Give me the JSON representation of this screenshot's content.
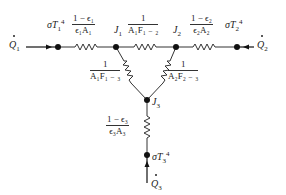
{
  "diagram": {
    "nodes": {
      "q1": {
        "label": "Q̇₁",
        "text": "Q",
        "sub": "1"
      },
      "q2": {
        "label": "Q̇₂",
        "text": "Q",
        "sub": "2"
      },
      "q3": {
        "label": "Q̇₃",
        "text": "Q",
        "sub": "3"
      },
      "eb1": {
        "label": "σT₁⁴",
        "text": "σT",
        "sub": "1",
        "sup": "4"
      },
      "eb2": {
        "label": "σT₂⁴",
        "text": "σT",
        "sub": "2",
        "sup": "4"
      },
      "eb3": {
        "label": "σT₃⁴",
        "text": "σT",
        "sub": "3",
        "sup": "4"
      },
      "j1": {
        "label": "J₁",
        "text": "J",
        "sub": "1"
      },
      "j2": {
        "label": "J₂",
        "text": "J",
        "sub": "2"
      },
      "j3": {
        "label": "J₃",
        "text": "J",
        "sub": "3"
      }
    },
    "resistors": {
      "r_surf1": {
        "num": "1 − ϵ₁",
        "den": "ϵ₁A₁"
      },
      "r_surf2": {
        "num": "1 − ϵ₂",
        "den": "ϵ₂A₂"
      },
      "r_surf3": {
        "num": "1 − ϵ₃",
        "den": "ϵ₃A₃"
      },
      "r_12": {
        "num": "1",
        "den": "A₁F₁ ₋ ₂"
      },
      "r_13": {
        "num": "1",
        "den": "A₁F₁ ₋ ₃"
      },
      "r_23": {
        "num": "1",
        "den": "A₂F₂ ₋ ₃"
      }
    }
  }
}
